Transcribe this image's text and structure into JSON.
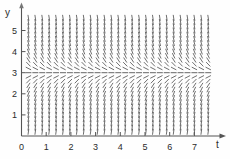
{
  "figure": {
    "kind": "slope-field",
    "background_color": "#fefefe",
    "ink_color": "#4a4a4a",
    "axis_color": "#555555"
  },
  "axes": {
    "x_axis_name": "t",
    "y_axis_name": "y",
    "origin_label": "0",
    "x_ticks": [
      "0",
      "1",
      "2",
      "3",
      "4",
      "5",
      "6",
      "7"
    ],
    "y_ticks": [
      "1",
      "2",
      "3",
      "4",
      "5"
    ]
  },
  "chart_data": {
    "type": "scatter",
    "title": "",
    "xlabel": "t",
    "ylabel": "y",
    "xlim": [
      0,
      7.7
    ],
    "ylim": [
      0,
      5.75
    ],
    "grid": false,
    "legend": "none",
    "x_ticks": [
      0,
      1,
      2,
      3,
      4,
      5,
      6,
      7
    ],
    "y_ticks": [
      1,
      2,
      3,
      4,
      5
    ],
    "equilibrium_lines": [
      3
    ],
    "slope_rule": "dy/dt proportional to (3 - y), slope magnitude grows with distance from y = 3",
    "grid_spacing": {
      "t": 0.28,
      "y": 0.2
    },
    "slope_samples": [
      {
        "y": 0.2,
        "slope": 9.0
      },
      {
        "y": 0.6,
        "slope": 7.2
      },
      {
        "y": 1.0,
        "slope": 6.0
      },
      {
        "y": 1.4,
        "slope": 4.8
      },
      {
        "y": 1.8,
        "slope": 3.6
      },
      {
        "y": 2.2,
        "slope": 2.4
      },
      {
        "y": 2.6,
        "slope": 1.2
      },
      {
        "y": 3.0,
        "slope": 0.0
      },
      {
        "y": 3.4,
        "slope": -1.2
      },
      {
        "y": 3.8,
        "slope": -2.4
      },
      {
        "y": 4.2,
        "slope": -3.6
      },
      {
        "y": 4.6,
        "slope": -4.8
      },
      {
        "y": 5.0,
        "slope": -6.0
      },
      {
        "y": 5.4,
        "slope": -7.2
      },
      {
        "y": 5.6,
        "slope": -8.1
      }
    ]
  }
}
